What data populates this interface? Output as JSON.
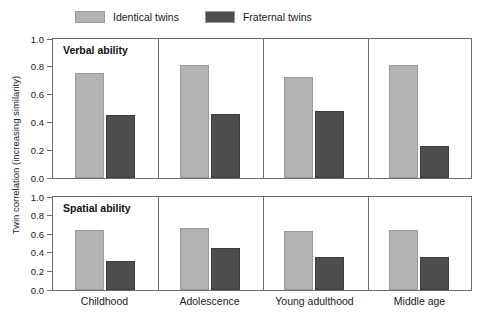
{
  "chart_data": {
    "type": "bar",
    "title": "",
    "xlabel": "",
    "ylabel": "Twin correlation (increasing similarity)",
    "ylim": [
      0.0,
      1.0
    ],
    "yticks": [
      "0.0",
      "0.2",
      "0.4",
      "0.6",
      "0.8",
      "1.0"
    ],
    "ytick_values": [
      0.0,
      0.2,
      0.4,
      0.6,
      0.8,
      1.0
    ],
    "grid": false,
    "legend_position": "top",
    "categories": [
      "Childhood",
      "Adolescence",
      "Young adulthood",
      "Middle age"
    ],
    "legend": [
      {
        "name": "Identical twins",
        "color": "#b3b3b3"
      },
      {
        "name": "Fraternal twins",
        "color": "#4d4d4d"
      }
    ],
    "panels": [
      {
        "label": "Verbal ability",
        "series": [
          {
            "name": "Identical twins",
            "values": [
              0.755,
              0.81,
              0.73,
              0.81
            ]
          },
          {
            "name": "Fraternal twins",
            "values": [
              0.45,
              0.46,
              0.485,
              0.23
            ]
          }
        ]
      },
      {
        "label": "Spatial ability",
        "series": [
          {
            "name": "Identical twins",
            "values": [
              0.65,
              0.67,
              0.63,
              0.64
            ]
          },
          {
            "name": "Fraternal twins",
            "values": [
              0.31,
              0.45,
              0.355,
              0.355
            ]
          }
        ]
      }
    ]
  }
}
